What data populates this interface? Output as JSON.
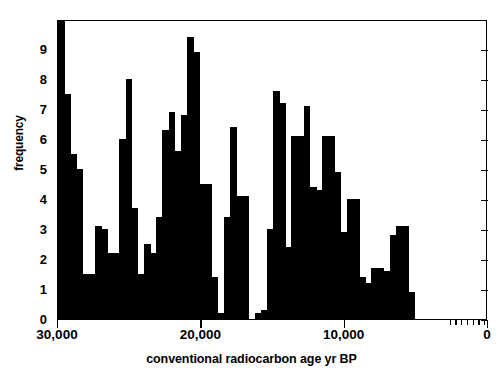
{
  "chart_data": {
    "type": "bar",
    "title": "",
    "subtitle": "",
    "xlabel": "conventional radiocarbon age  yr BP",
    "ylabel": "frequency",
    "orientation": "vertical",
    "grid": false,
    "legend": null,
    "xlim": [
      30000,
      0
    ],
    "xlim_note": "x axis is reversed: oldest (30,000 yr BP) at left, 0 at right",
    "ylim": [
      0,
      10
    ],
    "x_tick_labels": [
      "30,000",
      "20,000",
      "10,000",
      "0"
    ],
    "x_tick_values": [
      30000,
      20000,
      10000,
      0
    ],
    "y_tick_labels": [
      "0",
      "1",
      "2",
      "3",
      "4",
      "5",
      "6",
      "7",
      "8",
      "9"
    ],
    "y_tick_values": [
      0,
      1,
      2,
      3,
      4,
      5,
      6,
      7,
      8,
      9
    ],
    "x_minor_tick_values": [
      2600,
      2200,
      1800,
      1400,
      1000,
      600,
      200
    ],
    "bin_width": 430,
    "bin_centers": [
      29785,
      29355,
      28925,
      28495,
      28065,
      27635,
      27205,
      26775,
      26345,
      25915,
      25485,
      25055,
      24625,
      24195,
      23765,
      23335,
      22905,
      22475,
      22045,
      21615,
      21185,
      20755,
      20325,
      19895,
      19465,
      19035,
      18605,
      18175,
      17745,
      17315,
      16885,
      16455,
      16025,
      15595,
      15165,
      14735,
      14305,
      13875,
      13445,
      13015,
      12585,
      12155,
      11725,
      11295,
      10865,
      10435,
      10005,
      9575,
      9145,
      8715,
      8285,
      7855,
      7425,
      6995,
      6565,
      6135,
      5705,
      5275,
      4845,
      4415,
      3985,
      3555,
      3125,
      2695,
      2265,
      1835,
      1405,
      975,
      545,
      115
    ],
    "values": [
      10,
      7.5,
      5.5,
      5,
      1.5,
      1.5,
      3.1,
      3,
      2.2,
      2.2,
      6,
      8,
      3.7,
      1.5,
      2.5,
      2.2,
      3.4,
      6.3,
      6.9,
      5.6,
      6.8,
      9.4,
      8.9,
      4.5,
      4.5,
      1.4,
      0.2,
      3.4,
      6.4,
      4.1,
      4.1,
      0,
      0.2,
      0.3,
      3,
      7.6,
      7.2,
      2.4,
      6.1,
      6.1,
      7.1,
      4.4,
      4.3,
      6.1,
      6.1,
      4.9,
      2.9,
      4,
      4,
      1.4,
      1.2,
      1.7,
      1.7,
      1.6,
      2.8,
      3.1,
      3.1,
      0.9,
      0,
      0,
      0,
      0,
      0,
      0,
      0,
      0,
      0,
      0,
      0,
      0
    ]
  },
  "axis": {
    "ylabel_text": "frequency",
    "xlabel_text": "conventional radiocarbon age  yr BP"
  },
  "style": {
    "bar_color": "#000000",
    "frame_color": "#000000",
    "background": "#ffffff"
  }
}
